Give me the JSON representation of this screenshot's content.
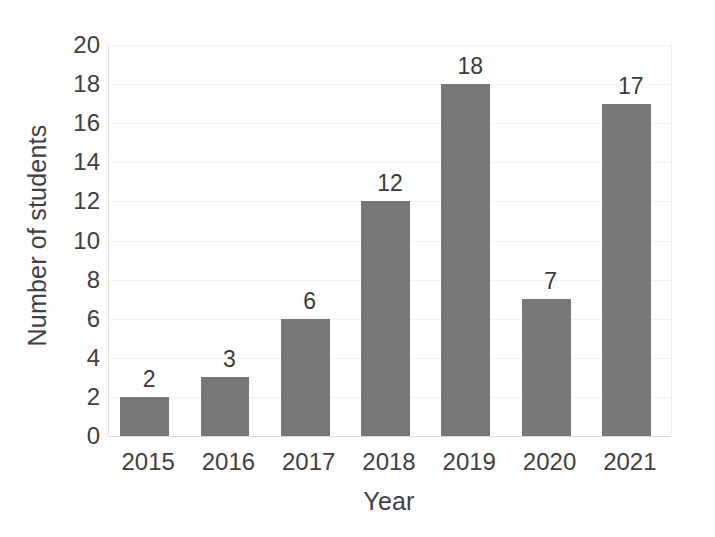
{
  "chart_data": {
    "type": "bar",
    "title": "",
    "subtitle": "",
    "xlabel": "Year",
    "ylabel": "Number of students",
    "categories": [
      "2015",
      "2016",
      "2017",
      "2018",
      "2019",
      "2020",
      "2021"
    ],
    "values": [
      2,
      3,
      6,
      12,
      18,
      7,
      17
    ],
    "data_labels": [
      "2",
      "3",
      "6",
      "12",
      "18",
      "7",
      "17"
    ],
    "series": [
      {
        "name": "Number of students",
        "values": [
          2,
          3,
          6,
          12,
          18,
          7,
          17
        ],
        "color": "#787878"
      }
    ],
    "ylim": [
      0,
      20
    ],
    "ytick_step": 2,
    "ytick_labels": [
      "20",
      "18",
      "16",
      "14",
      "12",
      "10",
      "8",
      "6",
      "4",
      "2",
      "0"
    ],
    "ytick_values": [
      20,
      18,
      16,
      14,
      12,
      10,
      8,
      6,
      4,
      2,
      0
    ],
    "xlim_categories": 7,
    "grid": true,
    "grid_axis": "y",
    "gridline_color": "#f3f3f3",
    "axis_color": "#d9d9d9",
    "legend": false,
    "legend_position": "none",
    "background": "#ffffff",
    "text_color": "#404040",
    "annotations": []
  }
}
